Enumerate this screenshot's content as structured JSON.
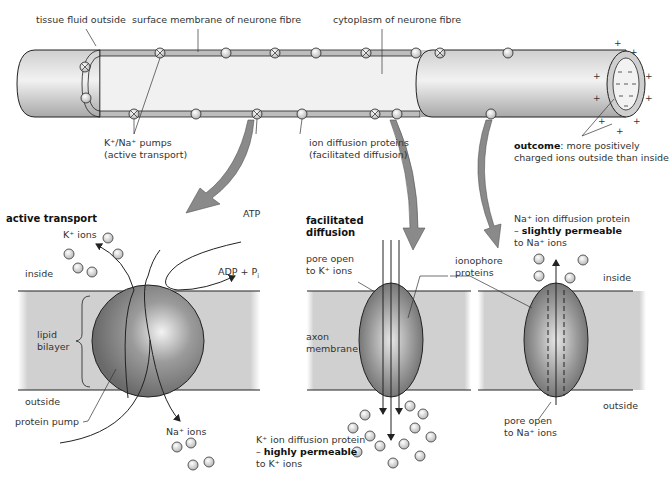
{
  "top": {
    "tissue_fluid": "tissue fluid outside",
    "surface_membrane": "surface membrane of neurone fibre",
    "cytoplasm": "cytoplasm of neurone fibre",
    "pumps_line1": "K⁺/Na⁺ pumps",
    "pumps_line2": "(active transport)",
    "diffusion_line1": "ion diffusion proteins",
    "diffusion_line2": "(facilitated diffusion)",
    "outcome_bold": "outcome",
    "outcome_rest": ": more positively",
    "outcome_line2": "charged ions outside than inside",
    "charge_outside": "+",
    "charge_inside": "−"
  },
  "active": {
    "title": "active transport",
    "k_ions": "K⁺ ions",
    "atp": "ATP",
    "adp": "ADP + P",
    "adp_sub": "i",
    "inside": "inside",
    "lipid1": "lipid",
    "lipid2": "bilayer",
    "outside": "outside",
    "pump": "protein pump",
    "na_ions": "Na⁺ ions"
  },
  "facilitated": {
    "title1": "facilitated",
    "title2": "diffusion",
    "pore1": "pore open",
    "pore2": "to K⁺ ions",
    "axon1": "axon",
    "axon2": "membrane",
    "iono1": "ionophore",
    "iono2": "proteins",
    "k_prot1": "K⁺ ion diffusion protein",
    "k_prot2_dash": "– ",
    "k_prot2_bold": "highly permeable",
    "k_prot3": "to K⁺ ions"
  },
  "na": {
    "prot1": "Na⁺ ion diffusion protein",
    "prot2_dash": "– ",
    "prot2_bold": "slightly permeable",
    "prot3": "to Na⁺ ions",
    "inside": "inside",
    "outside": "outside",
    "pore1": "pore open",
    "pore2": "to Na⁺ ions"
  },
  "colors": {
    "membrane_band": "#cfcfcf",
    "line": "#222222",
    "arrow_fill": "#8a8a8a"
  }
}
